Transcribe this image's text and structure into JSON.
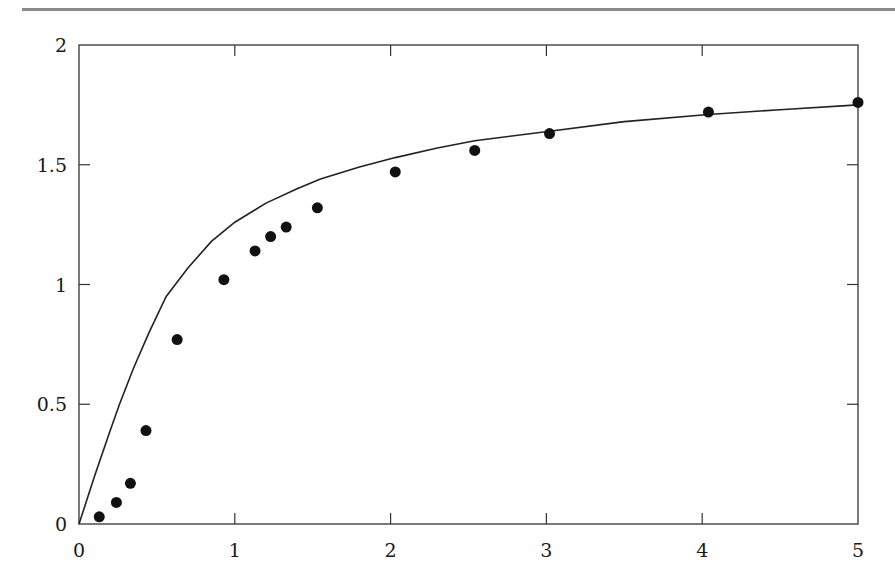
{
  "chart_data": {
    "type": "scatter",
    "title": "",
    "xlabel": "",
    "ylabel": "",
    "xlim": [
      0,
      5
    ],
    "ylim": [
      0,
      2
    ],
    "xticks": [
      "0",
      "1",
      "2",
      "3",
      "4",
      "5"
    ],
    "yticks": [
      "0",
      "0.5",
      "1",
      "1.5",
      "2"
    ],
    "grid": false,
    "legend": null,
    "series": [
      {
        "name": "data points",
        "type": "scatter",
        "marker": "filled-circle",
        "color": "#111111",
        "x": [
          0.13,
          0.24,
          0.33,
          0.43,
          0.63,
          0.93,
          1.13,
          1.23,
          1.33,
          1.53,
          2.03,
          2.54,
          3.02,
          4.04,
          5.0
        ],
        "y": [
          0.03,
          0.09,
          0.17,
          0.39,
          0.77,
          1.02,
          1.14,
          1.2,
          1.24,
          1.32,
          1.47,
          1.56,
          1.63,
          1.72,
          1.76
        ]
      },
      {
        "name": "fitted curve",
        "type": "line",
        "color": "#222222",
        "x": [
          0,
          0.1,
          0.2,
          0.26,
          0.35,
          0.45,
          0.56,
          0.7,
          0.85,
          1.0,
          1.2,
          1.4,
          1.55,
          1.8,
          2.03,
          2.3,
          2.54,
          3.02,
          3.5,
          4.04,
          4.5,
          5.0
        ],
        "y": [
          0,
          0.2,
          0.39,
          0.5,
          0.65,
          0.8,
          0.95,
          1.07,
          1.18,
          1.26,
          1.34,
          1.4,
          1.44,
          1.49,
          1.53,
          1.57,
          1.6,
          1.64,
          1.68,
          1.71,
          1.73,
          1.75
        ]
      }
    ]
  }
}
